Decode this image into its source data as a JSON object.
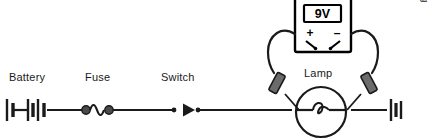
{
  "figure": {
    "background_color": "#ffffff",
    "line_color": "#1a1a1a",
    "credit": "2012 © Delmar, Cengage Learning"
  },
  "labels": {
    "battery": "Battery",
    "fuse": "Fuse",
    "switch": "Switch",
    "lamp": "Lamp"
  },
  "meter": {
    "reading": "9V",
    "positive_terminal": "+",
    "negative_terminal": "–",
    "body_color": "#ffffff",
    "display_border_color": "#000000"
  },
  "components": [
    {
      "name": "battery",
      "label": "Battery",
      "symbol": "battery-cells"
    },
    {
      "name": "fuse",
      "label": "Fuse",
      "symbol": "fuse-wavy"
    },
    {
      "name": "switch",
      "label": "Switch",
      "symbol": "switch-arrow"
    },
    {
      "name": "lamp",
      "label": "Lamp",
      "symbol": "lamp-circle-filament"
    },
    {
      "name": "voltmeter",
      "label": "9V",
      "symbol": "handheld-meter"
    }
  ],
  "probes": [
    {
      "name": "positive-probe",
      "terminal": "+",
      "side": "left"
    },
    {
      "name": "negative-probe",
      "terminal": "–",
      "side": "right"
    }
  ]
}
